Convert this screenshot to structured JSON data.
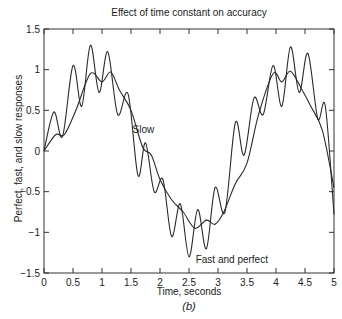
{
  "chart_data": {
    "type": "line",
    "title": "Effect of time constant on accuracy",
    "xlabel": "Time, seconds",
    "ylabel": "Perfect, fast, and slow responses",
    "caption": "(b)",
    "xlim": [
      0,
      5
    ],
    "ylim": [
      -1.5,
      1.5
    ],
    "xticks": [
      0,
      0.5,
      1,
      1.5,
      2,
      2.5,
      3,
      3.5,
      4,
      4.5,
      5
    ],
    "xtick_labels": [
      "0",
      "0.5",
      "1",
      "1.5",
      "2",
      "2.5",
      "3",
      "3.5",
      "4",
      "4.5",
      "5"
    ],
    "yticks": [
      1.5,
      1,
      0.5,
      0,
      -0.5,
      -1,
      -1.5
    ],
    "ytick_labels": [
      "1.5",
      "1",
      "0.5",
      "0",
      "−0.5",
      "−1",
      "−1.5"
    ],
    "grid": false,
    "legend": "none (inline annotations)",
    "annotations": [
      {
        "text": "Slow",
        "x": 1.7,
        "y": 0.25
      },
      {
        "text": "Fast and perfect",
        "x": 2.65,
        "y": -1.35
      }
    ],
    "series": [
      {
        "name": "Fast and perfect",
        "x": [
          0,
          0.17,
          0.32,
          0.5,
          0.65,
          0.8,
          0.95,
          1.1,
          1.27,
          1.45,
          1.62,
          1.75,
          1.9,
          2.05,
          2.2,
          2.35,
          2.5,
          2.65,
          2.8,
          2.95,
          3.12,
          3.3,
          3.45,
          3.62,
          3.78,
          3.95,
          4.1,
          4.25,
          4.4,
          4.55,
          4.72,
          4.85,
          5.0
        ],
        "values": [
          0,
          0.48,
          0.18,
          1.05,
          0.55,
          1.3,
          0.72,
          1.22,
          0.45,
          0.7,
          -0.3,
          0.1,
          -0.5,
          -0.35,
          -1.05,
          -0.65,
          -1.3,
          -0.72,
          -1.2,
          -0.45,
          -0.75,
          0.35,
          -0.05,
          0.65,
          0.45,
          1.05,
          0.55,
          1.28,
          0.72,
          1.2,
          0.4,
          0.55,
          -0.78
        ]
      },
      {
        "name": "Slow",
        "x": [
          0,
          0.2,
          0.35,
          0.55,
          0.8,
          1.0,
          1.15,
          1.3,
          1.5,
          1.7,
          1.85,
          2.0,
          2.2,
          2.4,
          2.6,
          2.8,
          2.95,
          3.1,
          3.3,
          3.5,
          3.7,
          3.95,
          4.1,
          4.25,
          4.45,
          4.6,
          4.8,
          5.0
        ],
        "values": [
          0,
          0.2,
          0.2,
          0.5,
          0.95,
          0.85,
          0.97,
          0.75,
          0.5,
          0.05,
          -0.05,
          -0.35,
          -0.6,
          -0.75,
          -0.95,
          -0.85,
          -0.9,
          -0.75,
          -0.4,
          -0.15,
          0.45,
          0.95,
          0.85,
          0.98,
          0.75,
          0.55,
          0.25,
          -0.45
        ]
      }
    ]
  }
}
